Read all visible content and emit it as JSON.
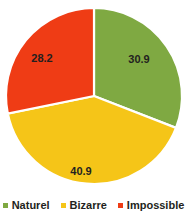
{
  "chart_data": {
    "type": "pie",
    "title": "",
    "categories": [
      "Naturel",
      "Bizarre",
      "Impossible"
    ],
    "values": [
      30.9,
      40.9,
      28.2
    ],
    "labels": [
      "30.9",
      "40.9",
      "28.2"
    ],
    "colors": [
      "#7fa942",
      "#f5c518",
      "#ef3c15"
    ],
    "legend_position": "bottom",
    "start_angle_deg": 0,
    "direction": "clockwise",
    "slice_gap": true,
    "grid": false,
    "xlabel": "",
    "ylabel": ""
  },
  "legend": {
    "items": [
      {
        "label": "Naturel",
        "color": "#7fa942"
      },
      {
        "label": "Bizarre",
        "color": "#f5c518"
      },
      {
        "label": "Impossible",
        "color": "#ef3c15"
      }
    ]
  },
  "slices": {
    "naturel": {
      "label": "30.9",
      "name": "Naturel",
      "color": "#7fa942"
    },
    "bizarre": {
      "label": "40.9",
      "name": "Bizarre",
      "color": "#f5c518"
    },
    "impossible": {
      "label": "28.2",
      "name": "Impossible",
      "color": "#ef3c15"
    }
  }
}
